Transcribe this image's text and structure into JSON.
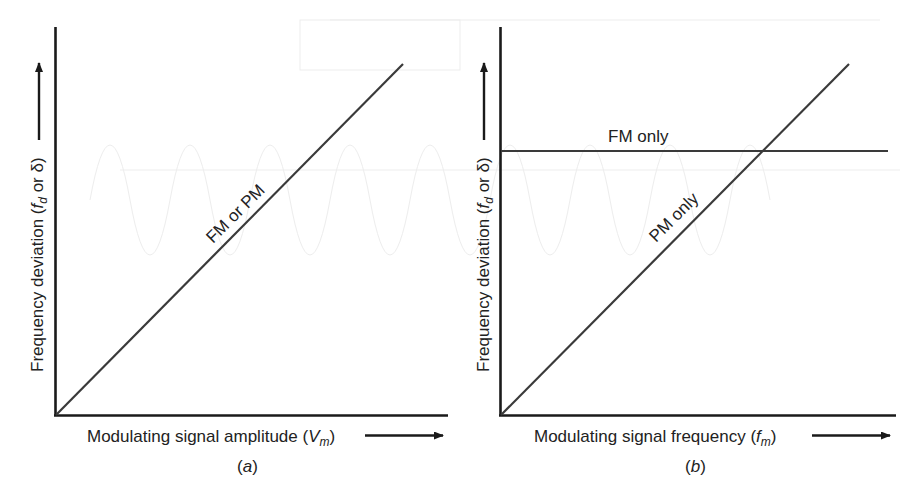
{
  "figure": {
    "panels": [
      {
        "id": "a",
        "caption": "(a)",
        "caption_letter": "a",
        "y_axis_label": {
          "prefix": "Frequency deviation (",
          "var": "f",
          "sub": "d",
          "suffix": " or δ)"
        },
        "x_axis_label": {
          "prefix": "Modulating signal amplitude (",
          "var": "V",
          "sub": "m",
          "suffix": ")"
        },
        "lines": [
          {
            "label": "FM or PM",
            "type": "diagonal"
          }
        ]
      },
      {
        "id": "b",
        "caption": "(b)",
        "caption_letter": "b",
        "y_axis_label": {
          "prefix": "Frequency deviation (",
          "var": "f",
          "sub": "d",
          "suffix": " or δ)"
        },
        "x_axis_label": {
          "prefix": "Modulating signal frequency (",
          "var": "f",
          "sub": "m",
          "suffix": ")"
        },
        "lines": [
          {
            "label": "FM only",
            "type": "horizontal"
          },
          {
            "label": "PM only",
            "type": "diagonal"
          }
        ]
      }
    ],
    "colors": {
      "axis": "#1a1a1a",
      "line": "#3a3a3a",
      "text": "#222222",
      "background": "#ffffff"
    }
  }
}
